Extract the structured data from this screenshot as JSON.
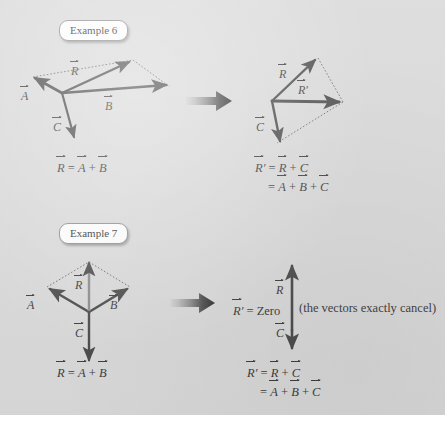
{
  "page": {
    "background_color": "#d9d9d9",
    "ink_color": "#3b3b3b",
    "vector_color": "#4a4a4a",
    "width": 445,
    "height": 425
  },
  "examples": [
    {
      "badge_label": "Example 6",
      "left_diagram": {
        "caption_lines": [
          "R = A + B"
        ],
        "vector_labels": [
          "A",
          "B",
          "C",
          "R"
        ],
        "description": "Three vectors A, B, C from a common origin with resultant R of A and B shown by dotted parallelogram"
      },
      "right_diagram": {
        "vector_labels": [
          "R",
          "R'",
          "C"
        ],
        "caption_lines": [
          "R' = R + C",
          "= A + B + C"
        ],
        "description": "R and C added head to tail giving R-prime pointing right"
      }
    },
    {
      "badge_label": "Example 7",
      "left_diagram": {
        "caption_lines": [
          "R = A + B"
        ],
        "vector_labels": [
          "A",
          "B",
          "C",
          "R"
        ],
        "description": "Symmetric diamond: A up-left, B up-right, resultant R straight up, C straight down"
      },
      "right_diagram": {
        "vector_labels": [
          "R",
          "C"
        ],
        "zero_statement": "R' = Zero",
        "annotation": "(the vectors exactly cancel)",
        "caption_lines": [
          "R' = R + C",
          "= A + B + C"
        ],
        "description": "R points up and C points down with equal length so they cancel"
      }
    }
  ],
  "symbols": {
    "equals": "=",
    "plus": "+",
    "letter_a": "A",
    "letter_b": "B",
    "letter_c": "C",
    "letter_r": "R",
    "prime": "′",
    "zero_word": "Zero"
  },
  "transition_arrow": {
    "name": "gradient-right-arrow",
    "count": 2,
    "gradient_from": "#cfcfcf",
    "gradient_to": "#2b2b2b"
  }
}
